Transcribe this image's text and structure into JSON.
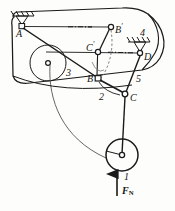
{
  "figure": {
    "type": "mechanism-linkage-diagram",
    "ink_color": "#1a1a1a",
    "background_color": "#fdfdfb"
  },
  "labels": {
    "point_a": "A",
    "point_b_prime_letter": "B",
    "point_b_prime_mark": "′",
    "point_c_prime_letter": "C",
    "point_c_prime_mark": "′",
    "point_b": "B",
    "point_c": "C",
    "point_d": "D",
    "link_1": "1",
    "link_2": "2",
    "link_3": "3",
    "link_4": "4",
    "link_5": "5",
    "force_symbol": "F",
    "force_subscript": "N"
  },
  "geometry": {
    "ground_pivot_a": {
      "x": 22,
      "y": 26
    },
    "ground_pivot_d": {
      "x": 140,
      "y": 53
    },
    "joint_b_prime": {
      "x": 111,
      "y": 27
    },
    "joint_c_prime": {
      "x": 98,
      "y": 52
    },
    "joint_b": {
      "x": 98,
      "y": 79
    },
    "joint_c": {
      "x": 125,
      "y": 94
    },
    "inner_circle_center": {
      "x": 48,
      "y": 63
    },
    "inner_circle_radius": 18,
    "bottom_wheel_center": {
      "x": 122,
      "y": 155
    },
    "bottom_wheel_radius": 16,
    "force_arrow_from": {
      "x": 117,
      "y": 196
    },
    "force_arrow_to": {
      "x": 117,
      "y": 173
    }
  }
}
